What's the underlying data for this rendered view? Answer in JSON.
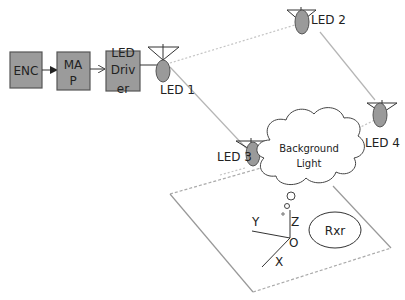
{
  "blocks": {
    "enc": "ENC",
    "map_line1": "MA",
    "map_line2": "P",
    "driver_line1": "LED",
    "driver_line2": "Driv",
    "driver_line3": "er"
  },
  "leds": {
    "led1": "LED 1",
    "led2": "LED 2",
    "led3": "LED 3",
    "led4": "LED 4"
  },
  "cloud": {
    "line1": "Background",
    "line2": "Light"
  },
  "receiver": "Rxr",
  "axes": {
    "x": "X",
    "y": "Y",
    "z": "Z",
    "origin": "O"
  },
  "colors": {
    "block_fill": "#9b9b9b",
    "led_fill": "#9a9a9a"
  }
}
